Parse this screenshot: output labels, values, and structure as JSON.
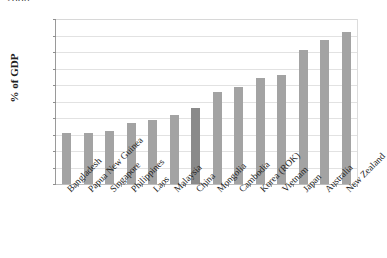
{
  "chart_data": {
    "type": "bar",
    "title": "2008",
    "title_note": "partially cropped at top edge of image",
    "xlabel": "",
    "ylabel": "% of GDP",
    "ylim": [
      0,
      10
    ],
    "ytick_step": 1,
    "grid": true,
    "legend": false,
    "legend_position": "none",
    "bar_color": "#a3a3a3",
    "highlight_color": "#8a8a8a",
    "highlight_category": "China",
    "categories": [
      "Bangladesh",
      "Papua New Guinea",
      "Singapore",
      "Philippines",
      "Laos",
      "Malaysia",
      "China",
      "Mongolia",
      "Cambodia",
      "Korea (ROK)",
      "Vietnam",
      "Japan",
      "Australia",
      "New Zealand"
    ],
    "values": [
      3.1,
      3.1,
      3.2,
      3.7,
      3.9,
      4.2,
      4.6,
      5.6,
      5.9,
      6.4,
      6.6,
      8.1,
      8.7,
      9.2
    ],
    "yticks": [
      "0",
      "1",
      "2",
      "3",
      "4",
      "5",
      "6",
      "7",
      "8",
      "9",
      "10"
    ]
  }
}
